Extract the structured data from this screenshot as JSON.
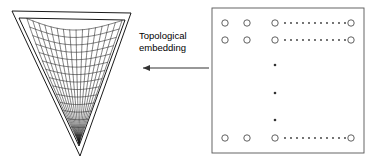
{
  "figure": {
    "background_color": "#ffffff",
    "stroke_color": "#000000",
    "width": 375,
    "height": 165
  },
  "annotation": {
    "line1": "Topological",
    "line2": "embedding",
    "arrow_direction": "left",
    "arrow_name": "leftward-arrow"
  },
  "left_panel": {
    "name": "triangular-simplex-with-mesh-surface",
    "shape": "inverted-triangle",
    "outer_triangle": {
      "points": "12,11 131,13 80,156",
      "stroke": "#000000",
      "fill": "none"
    },
    "inner_triangle": {
      "points": "19,18 125,20 79,146",
      "stroke": "#000000",
      "fill": "none"
    },
    "mesh": {
      "description": "curved saddle wireframe surface",
      "u_lines": 15,
      "v_lines": 15,
      "stroke": "#1a1a1a"
    }
  },
  "right_panel": {
    "name": "lattice-grid-of-nodes",
    "border": {
      "x": 1,
      "y": 1,
      "width": 152,
      "height": 145,
      "stroke": "#555555",
      "fill": "none"
    },
    "node_radius": 3.2,
    "node_stroke": "#444444",
    "dot_radius": 0.9,
    "dot_color": "#333333",
    "rows": [
      {
        "name": "row-top-1",
        "y": 16,
        "circles_x": [
          14,
          36,
          64,
          140
        ],
        "dots_x": [
          74,
          80,
          86,
          92,
          98,
          104,
          110,
          116,
          122,
          128,
          134
        ],
        "dot_count": 11
      },
      {
        "name": "row-top-2",
        "y": 33,
        "circles_x": [
          14,
          36,
          64,
          140
        ],
        "dots_x": [
          74,
          80,
          86,
          92,
          98,
          104,
          110,
          116,
          122,
          128,
          134
        ],
        "dot_count": 11
      },
      {
        "name": "row-bottom",
        "y": 131,
        "circles_x": [
          14,
          36,
          64,
          140
        ],
        "dots_x": [
          74,
          80,
          86,
          92,
          98,
          104,
          110,
          116,
          122,
          128,
          134
        ],
        "dot_count": 11
      }
    ],
    "vertical_ellipsis": {
      "name": "vertical-ellipsis-dots",
      "x": 64,
      "y_positions": [
        58,
        86,
        113
      ],
      "dot_count": 3,
      "dot_radius": 1.3
    }
  }
}
